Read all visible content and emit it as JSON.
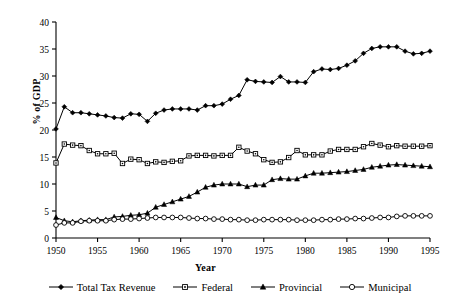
{
  "chart_data": {
    "type": "line",
    "title": "",
    "xlabel": "Year",
    "ylabel": "% of GDP",
    "xlim": [
      1950,
      1995
    ],
    "ylim": [
      0,
      40
    ],
    "ytick_step": 5,
    "xtick_step": 5,
    "grid": false,
    "legend_position": "bottom",
    "x": [
      1950,
      1951,
      1952,
      1953,
      1954,
      1955,
      1956,
      1957,
      1958,
      1959,
      1960,
      1961,
      1962,
      1963,
      1964,
      1965,
      1966,
      1967,
      1968,
      1969,
      1970,
      1971,
      1972,
      1973,
      1974,
      1975,
      1976,
      1977,
      1978,
      1979,
      1980,
      1981,
      1982,
      1983,
      1984,
      1985,
      1986,
      1987,
      1988,
      1989,
      1990,
      1991,
      1992,
      1993,
      1994,
      1995
    ],
    "xticklabels": [
      "1950",
      "1955",
      "1960",
      "1965",
      "1970",
      "1975",
      "1980",
      "1985",
      "1990",
      "1995"
    ],
    "yticklabels": [
      "0",
      "5",
      "10",
      "15",
      "20",
      "25",
      "30",
      "35",
      "40"
    ],
    "series": [
      {
        "name": "Total Tax Revenue",
        "marker": "filled-diamond",
        "values": [
          20.2,
          24.3,
          23.2,
          23.2,
          23.0,
          22.8,
          22.6,
          22.3,
          22.2,
          23.0,
          22.9,
          21.6,
          23.1,
          23.7,
          23.9,
          23.9,
          23.9,
          23.7,
          24.5,
          24.5,
          24.8,
          25.7,
          26.4,
          29.3,
          29.0,
          28.9,
          28.8,
          29.9,
          28.9,
          28.9,
          28.8,
          30.8,
          31.3,
          31.2,
          31.4,
          32.0,
          32.8,
          34.2,
          35.1,
          35.4,
          35.4,
          35.4,
          34.6,
          34.1,
          34.2,
          34.6
        ]
      },
      {
        "name": "Federal",
        "marker": "open-square",
        "values": [
          13.9,
          17.4,
          17.2,
          17.1,
          16.2,
          15.6,
          15.6,
          15.7,
          13.8,
          14.6,
          14.5,
          13.8,
          14.1,
          14.0,
          14.2,
          14.3,
          15.2,
          15.3,
          15.3,
          15.2,
          15.3,
          15.3,
          16.8,
          16.1,
          15.6,
          14.5,
          14.0,
          14.1,
          14.9,
          16.2,
          15.4,
          15.4,
          15.4,
          16.1,
          16.4,
          16.4,
          16.4,
          16.9,
          17.5,
          17.2,
          16.9,
          17.1,
          17.0,
          17.0,
          17.0,
          17.1
        ]
      },
      {
        "name": "Provincial",
        "marker": "filled-triangle",
        "values": [
          3.8,
          3.2,
          3.0,
          3.2,
          3.3,
          3.4,
          3.4,
          3.9,
          4.0,
          4.2,
          4.3,
          4.6,
          5.7,
          6.2,
          6.7,
          7.2,
          7.7,
          8.5,
          9.4,
          9.8,
          10.0,
          10.0,
          10.0,
          9.5,
          9.8,
          9.8,
          10.8,
          11.0,
          10.9,
          10.9,
          11.5,
          12.0,
          12.0,
          12.1,
          12.2,
          12.3,
          12.5,
          12.7,
          13.1,
          13.3,
          13.5,
          13.6,
          13.5,
          13.4,
          13.3,
          13.2
        ]
      },
      {
        "name": "Municipal",
        "marker": "open-circle",
        "values": [
          2.4,
          2.8,
          2.8,
          3.1,
          3.2,
          3.2,
          3.2,
          3.4,
          3.5,
          3.5,
          3.6,
          3.7,
          3.8,
          3.8,
          3.8,
          3.8,
          3.7,
          3.6,
          3.6,
          3.5,
          3.5,
          3.4,
          3.4,
          3.3,
          3.3,
          3.4,
          3.4,
          3.4,
          3.4,
          3.3,
          3.3,
          3.3,
          3.4,
          3.4,
          3.5,
          3.5,
          3.6,
          3.6,
          3.7,
          3.8,
          3.8,
          4.0,
          4.1,
          4.1,
          4.1,
          4.1
        ]
      }
    ]
  },
  "legend": {
    "items": [
      {
        "label": "Total Tax Revenue",
        "marker": "filled-diamond"
      },
      {
        "label": "Federal",
        "marker": "open-square"
      },
      {
        "label": "Provincial",
        "marker": "filled-triangle"
      },
      {
        "label": "Municipal",
        "marker": "open-circle"
      }
    ]
  },
  "axis": {
    "x_title": "Year",
    "y_title": "% of GDP"
  },
  "colors": {
    "line": "#000000",
    "axis": "#000000",
    "background": "#ffffff"
  }
}
